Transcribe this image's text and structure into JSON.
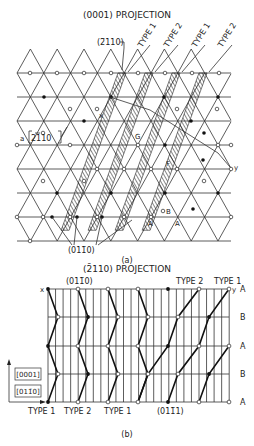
{
  "figure_a": {
    "title": "(0001) PROJECTION",
    "caption": "(a)",
    "plane_label_top": "(ī110)",
    "plane_label_top_text": "(2̄110)",
    "direction_label": "a [2̄110]",
    "direction_label_a": "a",
    "direction_label_vec": "2110",
    "plane_label_bottom": "(01ı0)",
    "plane_label_bottom_text": "(011̄0)",
    "type_labels": [
      "TYPE 1",
      "TYPE 2",
      "TYPE 1",
      "TYPE 2"
    ],
    "point_labels": {
      "x": "x",
      "y": "y",
      "G": "G",
      "F": "F",
      "B": "B",
      "A1": "A",
      "A2": "A"
    }
  },
  "figure_b": {
    "title": "(2̄110) PROJECTION",
    "caption": "(b)",
    "plane_label_top": "(011̄0)",
    "plane_label_bottom": "(011̄1)",
    "type_labels_top": [
      "TYPE 2",
      "TYPE 1"
    ],
    "type_labels_bottom": [
      "TYPE 1",
      "TYPE 2",
      "TYPE 1"
    ],
    "stacking_labels": [
      "A",
      "B",
      "A",
      "B",
      "A"
    ],
    "axis_label_vertical": "[0001]",
    "axis_label_horizontal": "[011̄0]",
    "point_labels": {
      "x": "x",
      "y": "y"
    }
  }
}
